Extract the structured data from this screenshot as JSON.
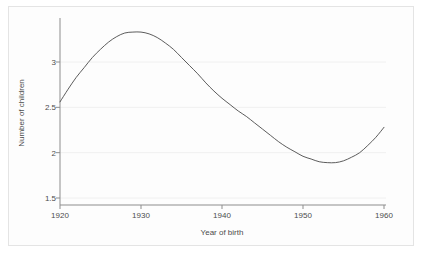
{
  "chart_data": {
    "type": "line",
    "title": "",
    "xlabel": "Year of birth",
    "ylabel": "Number of children",
    "xlim": [
      1920,
      1960
    ],
    "ylim": [
      1.5,
      3.4
    ],
    "grid": "horizontal",
    "legend": "none",
    "xticks": [
      1920,
      1930,
      1940,
      1950,
      1960
    ],
    "xtick_labels": [
      "1920",
      "1930",
      "1940",
      "1950",
      "1960"
    ],
    "yticks": [
      1.5,
      2,
      2.5,
      3
    ],
    "ytick_labels": [
      "1.5",
      "2",
      "2.5",
      "3"
    ],
    "series": [
      {
        "name": "Number of children",
        "color": "#4a4a4a",
        "x": [
          1920,
          1921,
          1922,
          1923,
          1924,
          1925,
          1926,
          1927,
          1928,
          1929,
          1930,
          1931,
          1932,
          1933,
          1934,
          1935,
          1936,
          1937,
          1938,
          1939,
          1940,
          1941,
          1942,
          1943,
          1944,
          1945,
          1946,
          1947,
          1948,
          1949,
          1950,
          1951,
          1952,
          1953,
          1954,
          1955,
          1956,
          1957,
          1958,
          1959,
          1960
        ],
        "values": [
          2.56,
          2.7,
          2.83,
          2.94,
          3.05,
          3.14,
          3.22,
          3.28,
          3.32,
          3.33,
          3.33,
          3.31,
          3.27,
          3.21,
          3.14,
          3.05,
          2.96,
          2.87,
          2.77,
          2.68,
          2.6,
          2.53,
          2.46,
          2.4,
          2.33,
          2.26,
          2.19,
          2.12,
          2.06,
          2.01,
          1.96,
          1.93,
          1.9,
          1.89,
          1.89,
          1.91,
          1.95,
          2.0,
          2.08,
          2.17,
          2.28
        ]
      }
    ],
    "annotations": {
      "peak": {
        "x": 1929,
        "y": 3.33
      },
      "trough": {
        "x": 1953.5,
        "y": 1.89
      },
      "start": {
        "x": 1920,
        "y": 2.56
      },
      "end": {
        "x": 1960,
        "y": 2.28
      }
    }
  },
  "axes": {
    "x_label": "Year of birth",
    "y_label": "Number of children"
  },
  "colors": {
    "line": "#4a4a4a",
    "axis": "#8d8d8d",
    "grid": "#f0f0f0",
    "text": "#4c4c4c",
    "background": "#ffffff",
    "frame": "#e4e4e4"
  }
}
